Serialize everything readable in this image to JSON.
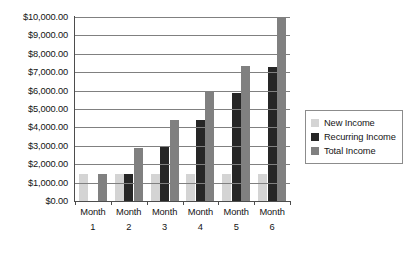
{
  "chart_data": {
    "type": "bar",
    "title": "",
    "xlabel": "",
    "ylabel": "",
    "categories": [
      "Month 1",
      "Month 2",
      "Month 3",
      "Month 4",
      "Month 5",
      "Month 6"
    ],
    "category_lines": [
      {
        "word": "Month",
        "num": "1"
      },
      {
        "word": "Month",
        "num": "2"
      },
      {
        "word": "Month",
        "num": "3"
      },
      {
        "word": "Month",
        "num": "4"
      },
      {
        "word": "Month",
        "num": "5"
      },
      {
        "word": "Month",
        "num": "6"
      }
    ],
    "series": [
      {
        "name": "New Income",
        "color": "#d4d4d4",
        "values": [
          1450,
          1450,
          1450,
          1450,
          1450,
          1450
        ]
      },
      {
        "name": "Recurring Income",
        "color": "#262626",
        "values": [
          0,
          1450,
          2950,
          4400,
          5850,
          7300
        ]
      },
      {
        "name": "Total Income",
        "color": "#808080",
        "values": [
          1450,
          2900,
          4400,
          5900,
          7350,
          9950
        ]
      }
    ],
    "ylim": [
      0,
      10000
    ],
    "ytick_values": [
      0,
      1000,
      2000,
      3000,
      4000,
      5000,
      6000,
      7000,
      8000,
      9000,
      10000
    ],
    "ytick_labels": [
      "$0.00",
      "$1,000.00",
      "$2,000.00",
      "$3,000.00",
      "$4,000.00",
      "$5,000.00",
      "$6,000.00",
      "$7,000.00",
      "$8,000.00",
      "$9,000.00",
      "$10,000.00"
    ],
    "grid": true,
    "legend_position": "right",
    "legend_entries": [
      {
        "label": "New Income",
        "color": "#d4d4d4"
      },
      {
        "label": "Recurring Income",
        "color": "#262626"
      },
      {
        "label": "Total Income",
        "color": "#808080"
      }
    ]
  }
}
